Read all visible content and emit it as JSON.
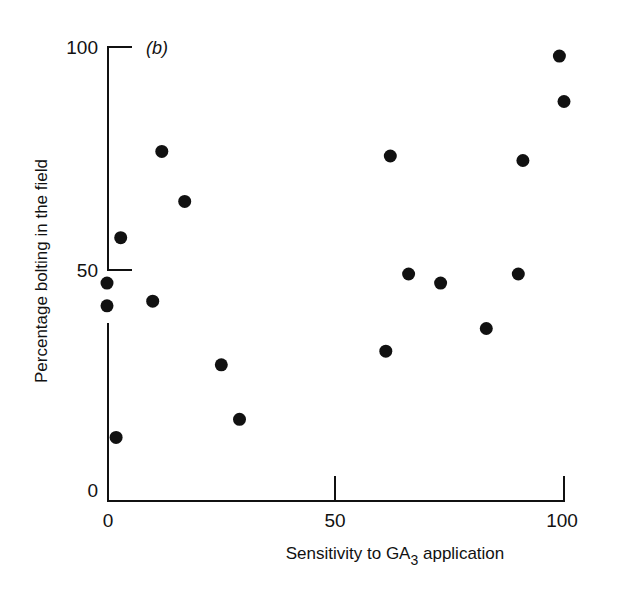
{
  "chart_data": {
    "type": "scatter",
    "panel_label": "(b)",
    "title": "",
    "xlabel": "Sensitivity to GA3 application",
    "xlabel_parts": {
      "pre": "Sensitivity to GA",
      "sub": "3",
      "post": " application"
    },
    "ylabel": "Percentage bolting in the field",
    "xlim": [
      0,
      100
    ],
    "ylim": [
      0,
      100
    ],
    "xticks": [
      0,
      50,
      100
    ],
    "yticks": [
      0,
      50,
      100
    ],
    "grid": false,
    "legend": null,
    "y_axis_break": [
      40,
      49
    ],
    "marker": {
      "shape": "circle",
      "color": "#111111",
      "filled": true
    },
    "points": [
      {
        "x": 0,
        "y": 48
      },
      {
        "x": 0,
        "y": 43
      },
      {
        "x": 2,
        "y": 14
      },
      {
        "x": 3,
        "y": 58
      },
      {
        "x": 10,
        "y": 44
      },
      {
        "x": 12,
        "y": 77
      },
      {
        "x": 17,
        "y": 66
      },
      {
        "x": 25,
        "y": 30
      },
      {
        "x": 29,
        "y": 18
      },
      {
        "x": 61,
        "y": 33
      },
      {
        "x": 62,
        "y": 76
      },
      {
        "x": 66,
        "y": 50
      },
      {
        "x": 73,
        "y": 48
      },
      {
        "x": 83,
        "y": 38
      },
      {
        "x": 90,
        "y": 50
      },
      {
        "x": 91,
        "y": 75
      },
      {
        "x": 99,
        "y": 98
      },
      {
        "x": 100,
        "y": 88
      }
    ]
  },
  "labels": {
    "ytick_100": "100",
    "ytick_50": "50",
    "ytick_0": "0",
    "xtick_0": "0",
    "xtick_50": "50",
    "xtick_100": "100",
    "panel": "(b)",
    "ylabel": "Percentage bolting in the field",
    "xlabel_pre": "Sensitivity to GA",
    "xlabel_sub": "3",
    "xlabel_post": " application"
  }
}
